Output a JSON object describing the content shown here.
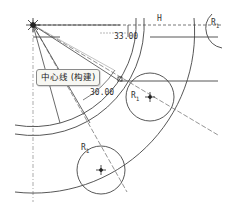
{
  "sketch": {
    "tooltip": "中心线 (构建)",
    "dimensions": [
      {
        "id": "linear-dim",
        "value": "33.00"
      },
      {
        "id": "angular-dim",
        "value": "30.00"
      }
    ],
    "constraints": {
      "horizontal": "H",
      "radius_labels": [
        "R",
        "R",
        "R",
        "R"
      ],
      "radius_subscript": "1"
    },
    "colors": {
      "line": "#444444",
      "construction": "#777777",
      "background": "#ffffff"
    }
  }
}
